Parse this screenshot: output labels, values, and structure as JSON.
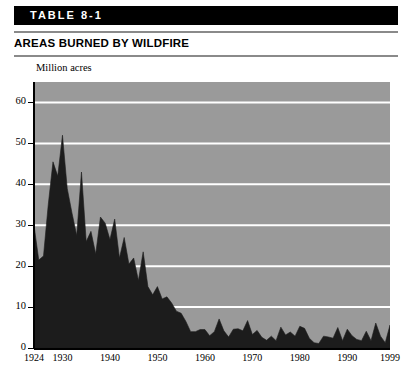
{
  "header": {
    "table_band_label": "TABLE 8-1",
    "title": "AREAS BURNED BY WILDFIRE"
  },
  "chart_data": {
    "type": "area",
    "title": "AREAS BURNED BY WILDFIRE",
    "subtitle": "TABLE 8-1",
    "xlabel": "",
    "ylabel": "Million acres",
    "ylim": [
      0,
      65
    ],
    "xlim": [
      1924,
      1999
    ],
    "yticks": [
      0,
      10,
      20,
      30,
      40,
      50,
      60
    ],
    "ytick_labels": [
      "0",
      "10",
      "20",
      "30",
      "40",
      "50",
      "60"
    ],
    "xticks": [
      1924,
      1930,
      1940,
      1950,
      1960,
      1970,
      1980,
      1990,
      1999
    ],
    "xtick_labels": [
      "1924",
      "1930",
      "1940",
      "1950",
      "1960",
      "1970",
      "1980",
      "1990",
      "1999"
    ],
    "grid": "horizontal-white",
    "legend": "none",
    "plot_background": "#9a9a9a",
    "series_color": "#1c1c1c",
    "series": [
      {
        "name": "Areas burned by wildfire",
        "units": "million acres",
        "x": [
          1924,
          1925,
          1926,
          1927,
          1928,
          1929,
          1930,
          1931,
          1932,
          1933,
          1934,
          1935,
          1936,
          1937,
          1938,
          1939,
          1940,
          1941,
          1942,
          1943,
          1944,
          1945,
          1946,
          1947,
          1948,
          1949,
          1950,
          1951,
          1952,
          1953,
          1954,
          1955,
          1956,
          1957,
          1958,
          1959,
          1960,
          1961,
          1962,
          1963,
          1964,
          1965,
          1966,
          1967,
          1968,
          1969,
          1970,
          1971,
          1972,
          1973,
          1974,
          1975,
          1976,
          1977,
          1978,
          1979,
          1980,
          1981,
          1982,
          1983,
          1984,
          1985,
          1986,
          1987,
          1988,
          1989,
          1990,
          1991,
          1992,
          1993,
          1994,
          1995,
          1996,
          1997,
          1998,
          1999
        ],
        "values": [
          30.0,
          21.5,
          22.5,
          35.0,
          45.5,
          42.0,
          52.0,
          39.0,
          33.0,
          27.5,
          43.0,
          26.0,
          28.5,
          23.0,
          32.0,
          30.5,
          26.5,
          31.5,
          22.0,
          27.0,
          20.5,
          22.0,
          16.5,
          23.5,
          15.0,
          13.0,
          15.0,
          12.0,
          12.5,
          11.0,
          9.0,
          8.5,
          6.5,
          4.0,
          4.0,
          4.5,
          4.5,
          3.0,
          4.0,
          7.1,
          4.2,
          2.7,
          4.6,
          4.7,
          4.2,
          6.7,
          3.3,
          4.3,
          2.6,
          1.9,
          2.9,
          1.8,
          5.1,
          3.2,
          3.9,
          2.9,
          5.3,
          4.8,
          2.4,
          1.3,
          1.1,
          2.9,
          2.7,
          2.4,
          5.0,
          1.8,
          4.6,
          3.0,
          2.1,
          1.8,
          4.1,
          1.8,
          6.1,
          2.9,
          1.3,
          5.6
        ]
      }
    ]
  },
  "axis": {
    "y_title": "Million acres"
  }
}
